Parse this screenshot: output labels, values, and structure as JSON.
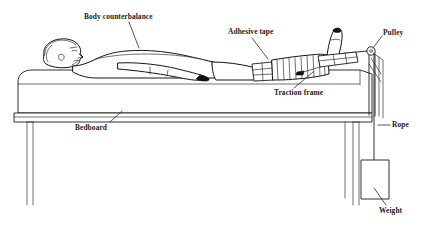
{
  "figure": {
    "canvas": {
      "width": 425,
      "height": 228
    },
    "background_color": "#ffffff",
    "line_color": "#1a1a1a"
  },
  "labels": {
    "body_counterbalance": "Body counterbalance",
    "adhesive_tape": "Adhesive tape",
    "traction_frame": "Traction frame",
    "pulley": "Pulley",
    "rope": "Rope",
    "weight": "Weight",
    "bedboard": "Bedboard"
  },
  "parts": {
    "patient": "supine-patient",
    "bed": "hospital-bed",
    "mattress": "mattress",
    "bed_legs": "bed-legs",
    "wrapped_leg": "bandaged-leg",
    "footplate": "footplate-spreader",
    "pulley_wheel": "pulley-wheel",
    "rope_line": "traction-rope",
    "weight_block": "hanging-weight"
  }
}
